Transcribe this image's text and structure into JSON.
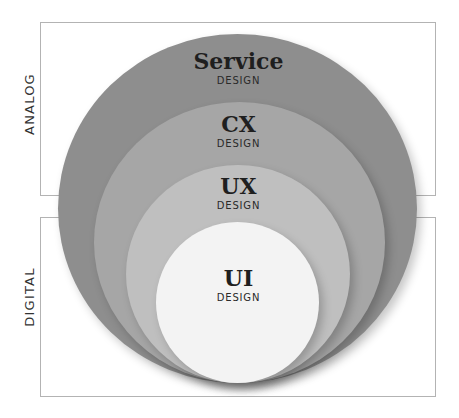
{
  "diagram": {
    "sections": [
      {
        "label": "ANALOG"
      },
      {
        "label": "DIGITAL"
      }
    ],
    "layers": [
      {
        "title": "Service",
        "subtitle": "DESIGN",
        "color": "#8e8e8e"
      },
      {
        "title": "CX",
        "subtitle": "DESIGN",
        "color": "#a6a6a6"
      },
      {
        "title": "UX",
        "subtitle": "DESIGN",
        "color": "#bfbfbf"
      },
      {
        "title": "UI",
        "subtitle": "DESIGN",
        "color": "#f3f3f3"
      }
    ],
    "frame_color": "#b3b3b3"
  }
}
